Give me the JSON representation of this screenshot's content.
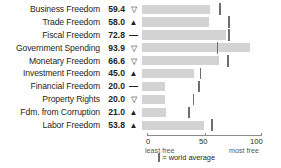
{
  "chart_data": {
    "type": "bar",
    "title": "",
    "xlabel": "",
    "ylabel": "",
    "xlim": [
      0,
      100
    ],
    "orientation": "horizontal",
    "grid": false,
    "legend_position": "bottom",
    "categories": [
      "Business Freedom",
      "Trade Freedom",
      "Fiscal Freedom",
      "Government Spending",
      "Monetary Freedom",
      "Investment Freedom",
      "Financial Freedom",
      "Property Rights",
      "Fdm. from Corruption",
      "Labor Freedom"
    ],
    "values": [
      59.4,
      58.0,
      72.8,
      93.9,
      66.6,
      45.0,
      20.0,
      20.0,
      21.0,
      53.8
    ],
    "value_labels": [
      "59.4",
      "58.0",
      "72.8",
      "93.9",
      "66.6",
      "45.0",
      "20.0",
      "20.0",
      "21.0",
      "53.8"
    ],
    "trends": [
      "down",
      "up",
      "flat",
      "down",
      "down",
      "up",
      "flat",
      "down",
      "up",
      "up"
    ],
    "trend_glyphs": [
      "▽",
      "▲",
      "—",
      "▽",
      "▽",
      "▲",
      "—",
      "▽",
      "▲",
      "▲"
    ],
    "world_average": [
      67.0,
      75.0,
      75.0,
      65.0,
      74.0,
      50.0,
      49.0,
      44.0,
      40.0,
      60.0
    ],
    "series": [
      {
        "name": "score",
        "values": [
          59.4,
          58.0,
          72.8,
          93.9,
          66.6,
          45.0,
          20.0,
          20.0,
          21.0,
          53.8
        ]
      },
      {
        "name": "world average",
        "values": [
          67.0,
          75.0,
          75.0,
          65.0,
          74.0,
          50.0,
          49.0,
          44.0,
          40.0,
          60.0
        ]
      }
    ],
    "axis": {
      "ticks": [
        0,
        50,
        100
      ],
      "tick_labels": [
        "0",
        "50",
        "100"
      ],
      "left_caption": "least free",
      "right_caption": "most free"
    },
    "legend": {
      "marker_label": "= world average"
    },
    "colors": {
      "bar": "#d3d3d3",
      "marker": "#6d6e71",
      "axis": "#8b8b8b",
      "text": "#231f20",
      "background": "#ffffff"
    }
  }
}
